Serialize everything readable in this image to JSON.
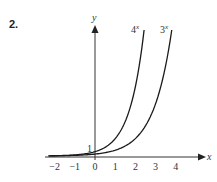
{
  "question_number": "2.",
  "chart_data": {
    "type": "line",
    "title": "",
    "xlabel": "x",
    "ylabel": "y",
    "x_ticks": [
      "−2",
      "−1",
      "0",
      "1",
      "2",
      "3",
      "4"
    ],
    "y_ticks": [
      "1"
    ],
    "xlim": [
      -2.5,
      5.4
    ],
    "grid": false,
    "legend": "inline labels at curve ends",
    "series": [
      {
        "name": "4^x",
        "label_base": "4",
        "label_exp": "x",
        "function": "4^x",
        "x": [
          -2,
          -1,
          0,
          0.5,
          1,
          1.5,
          2,
          2.45
        ],
        "values": [
          0.0625,
          0.25,
          1,
          2,
          4,
          8,
          16,
          29.9
        ]
      },
      {
        "name": "3^x",
        "label_base": "3",
        "label_exp": "x",
        "function": "3^x",
        "x": [
          -2,
          -1,
          0,
          1,
          2,
          3,
          3.5,
          3.85
        ],
        "values": [
          0.111,
          0.333,
          1,
          3,
          9,
          27,
          46.8,
          68.7
        ]
      }
    ],
    "annotations": [
      "y-intercept labeled 1"
    ]
  }
}
